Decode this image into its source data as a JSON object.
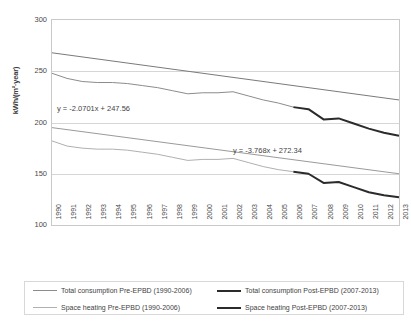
{
  "chart_data": {
    "type": "line",
    "title": "",
    "xlabel": "",
    "ylabel": "kWh/(m²·year)",
    "ylim": [
      100,
      300
    ],
    "yticks": [
      100,
      150,
      200,
      250,
      300
    ],
    "grid": true,
    "legend_position": "bottom",
    "x": [
      1990,
      1991,
      1992,
      1993,
      1994,
      1995,
      1996,
      1997,
      1998,
      1999,
      2000,
      2001,
      2002,
      2003,
      2004,
      2005,
      2006,
      2007,
      2008,
      2009,
      2010,
      2011,
      2012,
      2013
    ],
    "series": [
      {
        "name": "Total consumption Pre-EPBD (1990-2006)",
        "color": "#8c8c8c",
        "width": 1,
        "x": [
          1990,
          1991,
          1992,
          1993,
          1994,
          1995,
          1996,
          1997,
          1998,
          1999,
          2000,
          2001,
          2002,
          2003,
          2004,
          2005,
          2006
        ],
        "values": [
          248,
          243,
          240,
          239,
          239,
          238,
          236,
          234,
          231,
          228,
          229,
          229,
          230,
          226,
          222,
          219,
          215
        ]
      },
      {
        "name": "Total consumption Post-EPBD (2007-2013)",
        "color": "#2b2b2b",
        "width": 2,
        "x": [
          2006,
          2007,
          2008,
          2009,
          2010,
          2011,
          2012,
          2013
        ],
        "values": [
          215,
          213,
          203,
          204,
          199,
          194,
          190,
          187
        ]
      },
      {
        "name": "Space heating Pre-EPBD (1990-2006)",
        "color": "#b0b0b0",
        "width": 1,
        "x": [
          1990,
          1991,
          1992,
          1993,
          1994,
          1995,
          1996,
          1997,
          1998,
          1999,
          2000,
          2001,
          2002,
          2003,
          2004,
          2005,
          2006
        ],
        "values": [
          182,
          177,
          175,
          174,
          174,
          173,
          171,
          169,
          166,
          163,
          164,
          164,
          165,
          161,
          157,
          154,
          152
        ]
      },
      {
        "name": "Space heating Post-EPBD (2007-2013)",
        "color": "#2b2b2b",
        "width": 2,
        "x": [
          2006,
          2007,
          2008,
          2009,
          2010,
          2011,
          2012,
          2013
        ],
        "values": [
          152,
          150,
          141,
          142,
          137,
          132,
          129,
          127
        ]
      }
    ],
    "trendlines": [
      {
        "name": "Total consumption trendline",
        "equation": "y = -2.0701x + 247.56",
        "slope": -2.0701,
        "intercept": 247.56,
        "color": "#7a7a7a",
        "x_start": 1990,
        "x_end": 2013,
        "y_start": 268,
        "y_end": 222
      },
      {
        "name": "Space heating trendline",
        "equation": "y = -3.768x + 272.34",
        "slope": -3.768,
        "intercept": 272.34,
        "color": "#9a9a9a",
        "x_start": 1990,
        "x_end": 2013,
        "y_start": 195,
        "y_end": 150
      }
    ]
  },
  "axes": {
    "y_title": "kWh/(m²·year)",
    "y_ticks": [
      "300",
      "250",
      "200",
      "150",
      "100"
    ],
    "x_ticks": [
      "1990",
      "1991",
      "1992",
      "1993",
      "1994",
      "1995",
      "1996",
      "1997",
      "1998",
      "1999",
      "2000",
      "2001",
      "2002",
      "2003",
      "2004",
      "2005",
      "2006",
      "2007",
      "2008",
      "2009",
      "2010",
      "2011",
      "2012",
      "2013"
    ]
  },
  "annotations": {
    "equation_total": "y = -2.0701x + 247.56",
    "equation_space": "y = -3.768x + 272.34"
  },
  "legend": {
    "items": [
      {
        "label": "Total consumption Pre-EPBD (1990-2006)",
        "color": "#8c8c8c",
        "thickness": "1px"
      },
      {
        "label": "Total consumption Post-EPBD (2007-2013)",
        "color": "#2b2b2b",
        "thickness": "2px"
      },
      {
        "label": "Space heating Pre-EPBD (1990-2006)",
        "color": "#b0b0b0",
        "thickness": "1px"
      },
      {
        "label": "Space heating Post-EPBD (2007-2013)",
        "color": "#2b2b2b",
        "thickness": "2px"
      }
    ]
  }
}
